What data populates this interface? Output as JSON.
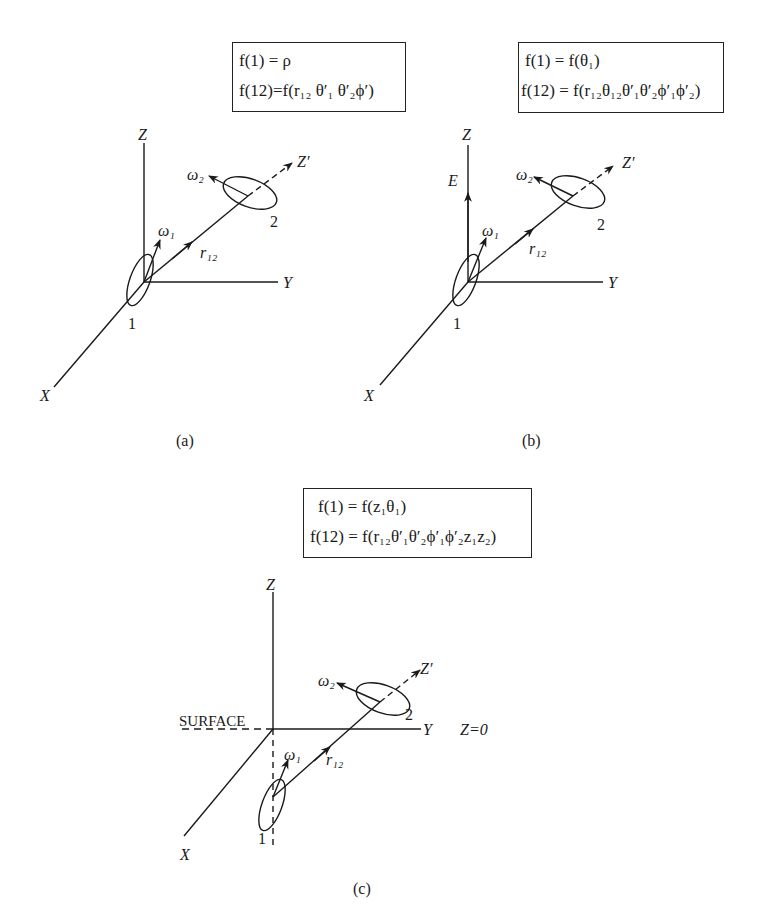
{
  "panels": [
    {
      "id": "a",
      "caption": "(a)",
      "equations": [
        "f(1) = ρ",
        "f(12)=f(r₁₂ θ′₁ θ′₂ϕ′)"
      ],
      "axis_labels": {
        "z": "Z",
        "y": "Y",
        "x": "X",
        "z_prime": "Z′"
      },
      "vector_labels": {
        "omega1": "ω₁",
        "omega2": "ω₂",
        "r12": "r₁₂"
      },
      "molecule_labels": {
        "m1": "1",
        "m2": "2"
      }
    },
    {
      "id": "b",
      "caption": "(b)",
      "equations": [
        "f(1) = f(θ₁)",
        "f(12) = f(r₁₂θ₁₂θ′₁θ′₂ϕ′₁ϕ′₂)"
      ],
      "axis_labels": {
        "z": "Z",
        "y": "Y",
        "x": "X",
        "z_prime": "Z′",
        "field": "E"
      },
      "vector_labels": {
        "omega1": "ω₁",
        "omega2": "ω₂",
        "r12": "r₁₂"
      },
      "molecule_labels": {
        "m1": "1",
        "m2": "2"
      }
    },
    {
      "id": "c",
      "caption": "(c)",
      "equations": [
        "f(1) = f(z₁θ₁)",
        "f(12) = f(r₁₂θ′₁θ′₂ϕ′₁ϕ′₂z₁z₂)"
      ],
      "axis_labels": {
        "z": "Z",
        "y": "Y",
        "x": "X",
        "z_prime": "Z′"
      },
      "vector_labels": {
        "omega1": "ω₁",
        "omega2": "ω₂",
        "r12": "r₁₂"
      },
      "molecule_labels": {
        "m1": "1",
        "m2": "2"
      },
      "surface_label": "SURFACE",
      "plane_label": "Z=0"
    }
  ]
}
